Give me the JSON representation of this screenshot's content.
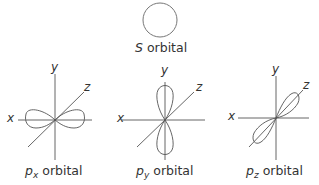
{
  "colors": {
    "line": "#555555",
    "text": "#333333"
  },
  "s_orbital": {
    "label_prefix": "S",
    "label_suffix": " orbital"
  },
  "orbitals": [
    {
      "id": "px",
      "symbol": "p",
      "subscript": "x",
      "suffix": " orbital",
      "axis_labels": {
        "x": "x",
        "y": "y",
        "z": "z"
      }
    },
    {
      "id": "py",
      "symbol": "p",
      "subscript": "y",
      "suffix": " orbital",
      "axis_labels": {
        "x": "x",
        "y": "y",
        "z": "z"
      }
    },
    {
      "id": "pz",
      "symbol": "p",
      "subscript": "z",
      "suffix": " orbital",
      "axis_labels": {
        "x": "x",
        "y": "y",
        "z": "z"
      }
    }
  ]
}
